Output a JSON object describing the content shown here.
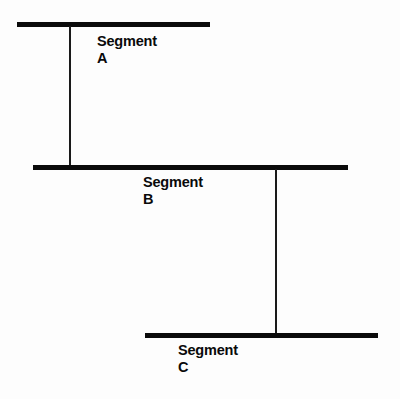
{
  "diagram": {
    "background_color": "#fdfdfd",
    "line_color": "#0b0b0b",
    "connector_color": "#1a1a1a",
    "segments": [
      {
        "id": "a",
        "label_line1": "Segment",
        "label_line2": "A",
        "line": {
          "x": 17,
          "y": 22,
          "width": 193,
          "thickness": 5
        },
        "label_position": {
          "x": 97,
          "y": 33
        }
      },
      {
        "id": "b",
        "label_line1": "Segment",
        "label_line2": "B",
        "line": {
          "x": 33,
          "y": 165,
          "width": 315,
          "thickness": 5
        },
        "label_position": {
          "x": 143,
          "y": 174
        }
      },
      {
        "id": "c",
        "label_line1": "Segment",
        "label_line2": "C",
        "line": {
          "x": 145,
          "y": 333,
          "width": 233,
          "thickness": 5
        },
        "label_position": {
          "x": 178,
          "y": 342
        }
      }
    ],
    "connectors": [
      {
        "id": "a-b",
        "from": "a",
        "to": "b",
        "x": 69,
        "y_top": 26,
        "height": 140,
        "thickness": 2
      },
      {
        "id": "b-c",
        "from": "b",
        "to": "c",
        "x": 275,
        "y_top": 169,
        "height": 166,
        "thickness": 2
      }
    ]
  }
}
